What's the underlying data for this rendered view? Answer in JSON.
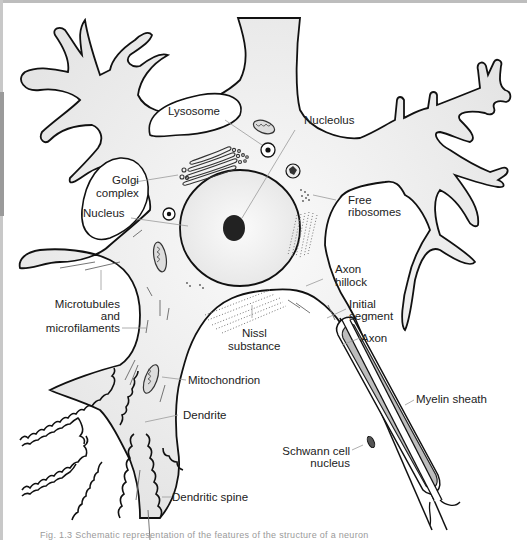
{
  "diagram": {
    "labels": {
      "lysosome": "Lysosome",
      "nucleolus": "Nucleolus",
      "golgi_1": "Golgi",
      "golgi_2": "complex",
      "nucleus": "Nucleus",
      "free_ribosomes_1": "Free",
      "free_ribosomes_2": "ribosomes",
      "axon_hillock_1": "Axon",
      "axon_hillock_2": "hillock",
      "initial_segment_1": "Initial",
      "initial_segment_2": "segment",
      "axon": "Axon",
      "microtubules_1": "Microtubules",
      "microtubules_2": "and",
      "microtubules_3": "microfilaments",
      "nissl_1": "Nissl",
      "nissl_2": "substance",
      "mitochondrion": "Mitochondrion",
      "myelin_sheath": "Myelin sheath",
      "dendrite": "Dendrite",
      "schwann_1": "Schwann cell",
      "schwann_2": "nucleus",
      "dendritic_spine": "Dendritic spine"
    },
    "caption": "Fig. 1.3  Schematic representation of the features of the structure of a neuron",
    "colors": {
      "outline": "#111111",
      "cytoplasm": "#eeeeee",
      "nucleus_fill": "#f3f3f3",
      "nucleolus_fill": "#222222",
      "myelin_fill": "#bdbdbd",
      "leader_line": "#9a9a9a"
    }
  }
}
